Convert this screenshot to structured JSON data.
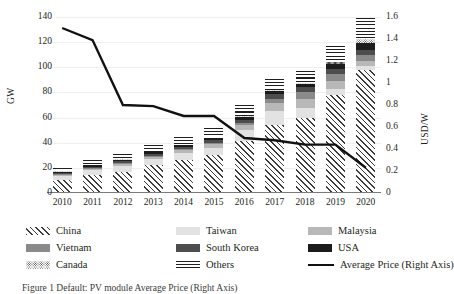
{
  "chart_data": {
    "type": "bar",
    "subtype": "stacked-bar-with-line",
    "title": "",
    "xlabel": "",
    "ylabel": "GW",
    "ylabel_right": "USD/W",
    "categories": [
      "2010",
      "2011",
      "2012",
      "2013",
      "2014",
      "2015",
      "2016",
      "2017",
      "2018",
      "2019",
      "2020"
    ],
    "ylim": [
      0,
      140
    ],
    "yticks": [
      0,
      20,
      40,
      60,
      80,
      100,
      120,
      140
    ],
    "ylim_right": [
      0,
      1.6
    ],
    "yticks_right": [
      "0",
      "0.2",
      "0.4",
      "0.6",
      "0.8",
      "1",
      "1.2",
      "1.4",
      "1.6"
    ],
    "grid": true,
    "legend_position": "below",
    "series": [
      {
        "name": "China",
        "pattern": "diagonal-hatch",
        "values": [
          10.0,
          14.0,
          17.0,
          22.0,
          26.0,
          30.0,
          41.0,
          54.0,
          60.0,
          78.0,
          98.0
        ]
      },
      {
        "name": "Taiwan",
        "pattern": "light-gray",
        "values": [
          3.5,
          4.0,
          4.5,
          5.0,
          5.5,
          6.0,
          9.0,
          11.0,
          8.0,
          5.0,
          3.0
        ]
      },
      {
        "name": "Malaysia",
        "pattern": "mid-gray",
        "values": [
          1.2,
          1.5,
          1.8,
          2.0,
          2.5,
          3.0,
          4.5,
          7.0,
          7.0,
          6.0,
          4.0
        ]
      },
      {
        "name": "Vietnam",
        "pattern": "dark-gray",
        "values": [
          0.3,
          0.4,
          0.5,
          0.6,
          0.8,
          1.0,
          1.5,
          3.0,
          5.0,
          6.0,
          5.0
        ]
      },
      {
        "name": "South Korea",
        "pattern": "very-dark-gray",
        "values": [
          1.0,
          1.2,
          1.4,
          1.6,
          1.8,
          2.0,
          2.5,
          3.5,
          4.0,
          4.0,
          3.5
        ]
      },
      {
        "name": "USA",
        "pattern": "black",
        "values": [
          1.0,
          1.1,
          1.2,
          1.3,
          1.5,
          1.7,
          2.0,
          2.5,
          3.0,
          4.0,
          6.0
        ]
      },
      {
        "name": "Canada",
        "pattern": "dotted",
        "values": [
          0.2,
          0.2,
          0.3,
          0.3,
          0.4,
          0.4,
          0.5,
          0.6,
          0.8,
          1.0,
          3.0
        ]
      },
      {
        "name": "Others",
        "pattern": "horizontal-lines",
        "values": [
          2.8,
          3.6,
          4.3,
          5.2,
          6.5,
          7.9,
          9.0,
          9.4,
          9.2,
          13.0,
          16.5
        ]
      }
    ],
    "line_series": {
      "name": "Average Price (Right Axis)",
      "axis": "right",
      "unit": "USD/W",
      "color": "#111111",
      "values": [
        1.5,
        1.39,
        0.8,
        0.79,
        0.7,
        0.7,
        0.5,
        0.48,
        0.44,
        0.44,
        0.23
      ]
    }
  },
  "axes": {
    "left": {
      "title": "GW",
      "ticks": [
        "140",
        "120",
        "100",
        "80",
        "60",
        "40",
        "20",
        "0"
      ]
    },
    "right": {
      "title": "USD/W",
      "ticks": [
        "1.6",
        "1.4",
        "1.2",
        "1",
        "0.8",
        "0.6",
        "0.4",
        "0.2",
        "0"
      ]
    },
    "x": {
      "ticks": [
        "2010",
        "2011",
        "2012",
        "2013",
        "2014",
        "2015",
        "2016",
        "2017",
        "2018",
        "2019",
        "2020"
      ]
    }
  },
  "legend": {
    "items": [
      {
        "label": "China",
        "key": "china"
      },
      {
        "label": "Taiwan",
        "key": "taiwan"
      },
      {
        "label": "Malaysia",
        "key": "malaysia"
      },
      {
        "label": "Vietnam",
        "key": "vietnam"
      },
      {
        "label": "South Korea",
        "key": "southkorea"
      },
      {
        "label": "USA",
        "key": "usa"
      },
      {
        "label": "Canada",
        "key": "canada"
      },
      {
        "label": "Others",
        "key": "others"
      },
      {
        "label": "Average Price (Right Axis)",
        "key": "avgprice"
      }
    ]
  },
  "caption": {
    "text": "Figure 1 Default: PV module Average Price (Right Axis)"
  },
  "colors": {
    "taiwan": "#e2e2e2",
    "malaysia": "#b8b8b8",
    "vietnam": "#8a8a8a",
    "southkorea": "#4d4d4d",
    "usa": "#1c1c1c",
    "line": "#111111",
    "grid": "#efefef",
    "axis": "#7a7a7a"
  }
}
